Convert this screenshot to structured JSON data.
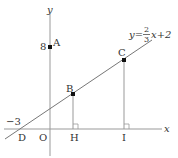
{
  "diagram": {
    "axes": {
      "x_label": "x",
      "y_label": "y",
      "origin_label": "O"
    },
    "line": {
      "equation_prefix": "y=",
      "fraction_numerator": "2",
      "fraction_denominator": "3",
      "equation_suffix": "x+2"
    },
    "points": {
      "A": {
        "label": "A",
        "value_label": "8"
      },
      "B": {
        "label": "B"
      },
      "C": {
        "label": "C"
      },
      "D": {
        "label": "D",
        "value_label": "−3"
      },
      "H": {
        "label": "H"
      },
      "I": {
        "label": "I"
      }
    },
    "colors": {
      "line": "#555555",
      "axis": "#888888",
      "point": "#111111"
    }
  }
}
